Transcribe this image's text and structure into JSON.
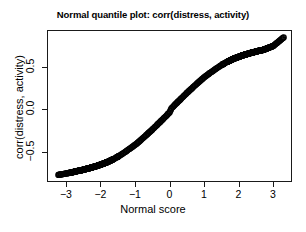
{
  "chart_data": {
    "type": "scatter",
    "title": "Normal quantile plot: corr(distress, activity)",
    "xlabel": "Normal score",
    "ylabel": "corr(distress, activity)",
    "xticks": [
      "-3",
      "-2",
      "-1",
      "0",
      "1",
      "2",
      "3"
    ],
    "xtick_values": [
      -3,
      -2,
      -1,
      0,
      1,
      2,
      3
    ],
    "yticks": [
      "0.5",
      "0.0",
      "-0.5"
    ],
    "ytick_values": [
      0.5,
      0.0,
      -0.5
    ],
    "xlim": [
      -3.55,
      3.55
    ],
    "ylim": [
      -0.85,
      0.93
    ],
    "grid": false,
    "legend": null,
    "marker": "open-circle",
    "marker_color": "#000000",
    "series": [
      {
        "name": "corr(distress, activity)",
        "x": [
          -3.25,
          -2.98,
          -2.85,
          -2.76,
          -2.68,
          -2.6,
          -2.53,
          -2.47,
          -2.41,
          -2.35,
          -2.3,
          -2.25,
          -2.2,
          -2.15,
          -2.1,
          -2.06,
          -2.02,
          -1.98,
          -1.94,
          -1.9,
          -1.86,
          -1.82,
          -1.78,
          -1.75,
          -1.71,
          -1.68,
          -1.64,
          -1.61,
          -1.58,
          -1.55,
          -1.51,
          -1.48,
          -1.45,
          -1.42,
          -1.39,
          -1.36,
          -1.33,
          -1.3,
          -1.27,
          -1.25,
          -1.22,
          -1.19,
          -1.16,
          -1.13,
          -1.11,
          -1.08,
          -1.05,
          -1.03,
          -1.0,
          -0.97,
          -0.95,
          -0.92,
          -0.9,
          -0.87,
          -0.85,
          -0.82,
          -0.8,
          -0.77,
          -0.75,
          -0.72,
          -0.7,
          -0.67,
          -0.65,
          -0.63,
          -0.6,
          -0.58,
          -0.55,
          -0.53,
          -0.51,
          -0.48,
          -0.46,
          -0.44,
          -0.41,
          -0.39,
          -0.37,
          -0.35,
          -0.32,
          -0.3,
          -0.28,
          -0.26,
          -0.23,
          -0.21,
          -0.19,
          -0.17,
          -0.14,
          -0.12,
          -0.1,
          -0.08,
          -0.06,
          -0.03,
          -0.01,
          0.01,
          0.03,
          0.06,
          0.08,
          0.1,
          0.12,
          0.14,
          0.17,
          0.19,
          0.21,
          0.23,
          0.26,
          0.28,
          0.3,
          0.32,
          0.35,
          0.37,
          0.39,
          0.41,
          0.44,
          0.46,
          0.48,
          0.51,
          0.53,
          0.55,
          0.58,
          0.6,
          0.63,
          0.65,
          0.67,
          0.7,
          0.72,
          0.75,
          0.77,
          0.8,
          0.82,
          0.85,
          0.87,
          0.9,
          0.92,
          0.95,
          0.97,
          1.0,
          1.03,
          1.05,
          1.08,
          1.11,
          1.13,
          1.16,
          1.19,
          1.22,
          1.25,
          1.27,
          1.3,
          1.33,
          1.36,
          1.39,
          1.42,
          1.45,
          1.48,
          1.51,
          1.55,
          1.58,
          1.61,
          1.64,
          1.68,
          1.71,
          1.75,
          1.78,
          1.82,
          1.86,
          1.9,
          1.94,
          1.98,
          2.02,
          2.06,
          2.1,
          2.15,
          2.2,
          2.25,
          2.3,
          2.35,
          2.41,
          2.47,
          2.53,
          2.6,
          2.68,
          2.76,
          2.85,
          2.98,
          3.28
        ],
        "y": [
          -0.755,
          -0.735,
          -0.725,
          -0.715,
          -0.708,
          -0.702,
          -0.695,
          -0.688,
          -0.682,
          -0.676,
          -0.67,
          -0.664,
          -0.658,
          -0.652,
          -0.646,
          -0.64,
          -0.634,
          -0.628,
          -0.622,
          -0.616,
          -0.61,
          -0.603,
          -0.596,
          -0.589,
          -0.582,
          -0.575,
          -0.568,
          -0.561,
          -0.554,
          -0.547,
          -0.539,
          -0.531,
          -0.523,
          -0.515,
          -0.507,
          -0.499,
          -0.491,
          -0.483,
          -0.475,
          -0.467,
          -0.459,
          -0.451,
          -0.443,
          -0.435,
          -0.427,
          -0.419,
          -0.411,
          -0.403,
          -0.395,
          -0.387,
          -0.378,
          -0.369,
          -0.36,
          -0.351,
          -0.342,
          -0.333,
          -0.324,
          -0.315,
          -0.306,
          -0.297,
          -0.288,
          -0.279,
          -0.27,
          -0.261,
          -0.252,
          -0.243,
          -0.234,
          -0.225,
          -0.216,
          -0.207,
          -0.198,
          -0.189,
          -0.18,
          -0.171,
          -0.162,
          -0.153,
          -0.144,
          -0.135,
          -0.126,
          -0.117,
          -0.108,
          -0.099,
          -0.09,
          -0.081,
          -0.072,
          -0.063,
          -0.054,
          -0.045,
          -0.036,
          -0.027,
          -0.009,
          0.009,
          0.027,
          0.036,
          0.045,
          0.054,
          0.063,
          0.072,
          0.081,
          0.09,
          0.099,
          0.108,
          0.117,
          0.126,
          0.135,
          0.144,
          0.153,
          0.162,
          0.171,
          0.18,
          0.189,
          0.198,
          0.207,
          0.216,
          0.225,
          0.234,
          0.243,
          0.252,
          0.261,
          0.27,
          0.279,
          0.288,
          0.297,
          0.306,
          0.315,
          0.324,
          0.333,
          0.342,
          0.351,
          0.36,
          0.369,
          0.378,
          0.387,
          0.395,
          0.403,
          0.411,
          0.419,
          0.427,
          0.435,
          0.443,
          0.451,
          0.459,
          0.467,
          0.475,
          0.483,
          0.491,
          0.499,
          0.507,
          0.515,
          0.523,
          0.531,
          0.539,
          0.547,
          0.554,
          0.561,
          0.568,
          0.575,
          0.582,
          0.589,
          0.596,
          0.603,
          0.61,
          0.616,
          0.622,
          0.628,
          0.634,
          0.64,
          0.646,
          0.652,
          0.658,
          0.664,
          0.67,
          0.676,
          0.682,
          0.688,
          0.695,
          0.702,
          0.708,
          0.72,
          0.735,
          0.755,
          0.855
        ]
      }
    ]
  }
}
